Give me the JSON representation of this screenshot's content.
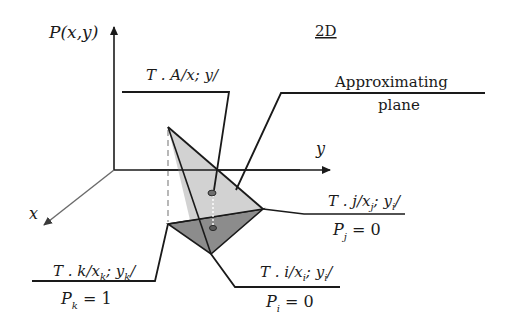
{
  "diagram": {
    "title": "2D",
    "axes": {
      "vertical": "P(x,y)",
      "horizontal": "y",
      "depth": "x"
    },
    "labels": {
      "point_A": "T . A/x; y/",
      "approx_line1": "Approximating",
      "approx_line2": "plane",
      "point_j": "T . j/x",
      "point_j_sub": "j",
      "point_j_rest": "; y",
      "point_j_sub2": "i",
      "point_j_end": "/",
      "point_j_value": "P",
      "point_j_value_sub": "j",
      "point_j_value_eq": " = 0",
      "point_k": "T . k/x",
      "point_k_sub": "k",
      "point_k_rest": "; y",
      "point_k_sub2": "k",
      "point_k_end": "/",
      "point_k_value": "P",
      "point_k_value_sub": "k",
      "point_k_value_eq": " = 1",
      "point_i": "T . i/x",
      "point_i_sub": "i",
      "point_i_rest": "; y",
      "point_i_sub2": "i",
      "point_i_end": "/",
      "point_i_value": "P",
      "point_i_value_sub": "i",
      "point_i_value_eq": " = 0"
    },
    "colors": {
      "line": "#1a1a1a",
      "axis_x": "#6a6a6a",
      "plane_fill": "#cfcfcf",
      "lower_fill": "#8c8c8c",
      "dashed": "#9a9a9a"
    }
  }
}
